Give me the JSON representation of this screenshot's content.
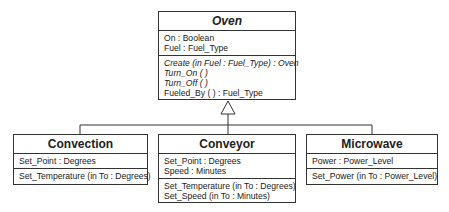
{
  "diagram": {
    "type": "UML class diagram",
    "parent": {
      "name": "Oven",
      "attributes": [
        "On : Boolean",
        "Fuel : Fuel_Type"
      ],
      "operations": [
        {
          "text": "Create (in Fuel : Fuel_Type) : Oven",
          "italic": true
        },
        {
          "text": "Turn_On ( )",
          "italic": true
        },
        {
          "text": "Turn_Off ( )",
          "italic": true
        },
        {
          "text": "Fueled_By ( ) : Fuel_Type",
          "italic": false
        }
      ]
    },
    "children": [
      {
        "name": "Convection",
        "attributes": [
          "Set_Point : Degrees"
        ],
        "operations": [
          "Set_Temperature (in To : Degrees)"
        ]
      },
      {
        "name": "Conveyor",
        "attributes": [
          "Set_Point : Degrees",
          "Speed : Minutes"
        ],
        "operations": [
          "Set_Temperature (in To : Degrees)",
          "Set_Speed (in To : Minutes)"
        ]
      },
      {
        "name": "Microwave",
        "attributes": [
          "Power : Power_Level"
        ],
        "operations": [
          "Set_Power (in To : Power_Level)"
        ]
      }
    ],
    "relationship": "generalization"
  }
}
